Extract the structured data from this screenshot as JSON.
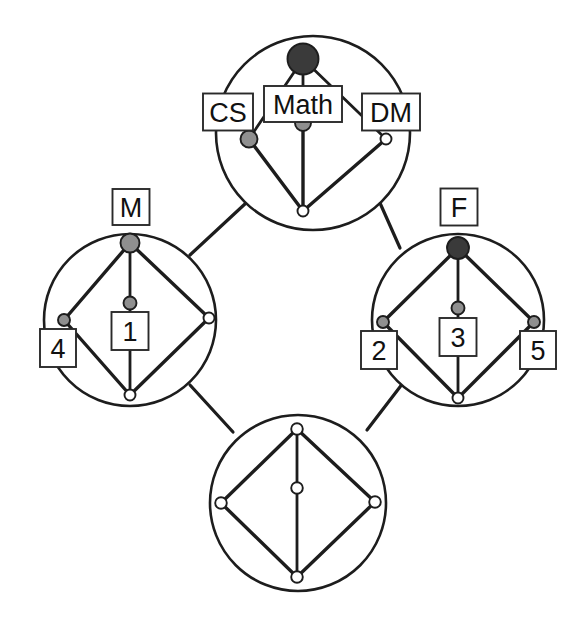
{
  "diagram": {
    "colors": {
      "background": "#ffffff",
      "stroke": "#1d1d1d",
      "vertex_dark": "#3a3a3a",
      "vertex_gray": "#8f8f8f",
      "vertex_white": "#ffffff",
      "label_box_fill": "#ffffff",
      "label_text": "#111111"
    },
    "clusters": [
      {
        "id": "cluster-top",
        "name": "top-cluster",
        "cx": 313,
        "cy": 133,
        "r": 97,
        "vertices": [
          {
            "id": "t-apex",
            "name": "math-vertex",
            "cx": 303,
            "cy": 59,
            "r": 15.5,
            "fill": "vertex_dark",
            "label": "Math",
            "label_x": 303,
            "label_y": 104,
            "box_w": 78,
            "box_h": 36,
            "font_size": 27
          },
          {
            "id": "t-left",
            "name": "cs-vertex",
            "cx": 249,
            "cy": 139,
            "r": 8.5,
            "fill": "vertex_gray",
            "label": "CS",
            "label_x": 228,
            "label_y": 112,
            "box_w": 50,
            "box_h": 37,
            "font_size": 27
          },
          {
            "id": "t-center",
            "name": "center-vertex-top",
            "cx": 303,
            "cy": 123,
            "r": 8.0,
            "fill": "vertex_gray",
            "label": "",
            "label_x": 0,
            "label_y": 0,
            "box_w": 0,
            "box_h": 0,
            "font_size": 0
          },
          {
            "id": "t-right",
            "name": "dm-vertex",
            "cx": 386,
            "cy": 139,
            "r": 5.5,
            "fill": "vertex_white",
            "label": "DM",
            "label_x": 391,
            "label_y": 112,
            "box_w": 58,
            "box_h": 37,
            "font_size": 27
          },
          {
            "id": "t-bottom",
            "name": "bottom-vertex-top",
            "cx": 303,
            "cy": 211,
            "r": 5.5,
            "fill": "vertex_white",
            "label": "",
            "label_x": 0,
            "label_y": 0,
            "box_w": 0,
            "box_h": 0,
            "font_size": 0
          }
        ]
      },
      {
        "id": "cluster-left",
        "name": "left-cluster",
        "cx": 130,
        "cy": 320,
        "r": 86,
        "vertices": [
          {
            "id": "l-apex",
            "name": "m-vertex",
            "cx": 130,
            "cy": 243,
            "r": 9.5,
            "fill": "vertex_gray",
            "label": "M",
            "label_x": 131,
            "label_y": 207,
            "box_w": 37,
            "box_h": 36,
            "font_size": 27
          },
          {
            "id": "l-left",
            "name": "vertex-4",
            "cx": 64,
            "cy": 320,
            "r": 6.0,
            "fill": "vertex_gray",
            "label": "4",
            "label_x": 58,
            "label_y": 348,
            "box_w": 36,
            "box_h": 38,
            "font_size": 27
          },
          {
            "id": "l-center",
            "name": "vertex-1",
            "cx": 130,
            "cy": 303,
            "r": 6.5,
            "fill": "vertex_gray",
            "label": "1",
            "label_x": 130,
            "label_y": 331,
            "box_w": 37,
            "box_h": 38,
            "font_size": 27
          },
          {
            "id": "l-right",
            "name": "right-vertex-left",
            "cx": 209,
            "cy": 318,
            "r": 5.5,
            "fill": "vertex_white",
            "label": "",
            "label_x": 0,
            "label_y": 0,
            "box_w": 0,
            "box_h": 0,
            "font_size": 0
          },
          {
            "id": "l-bottom",
            "name": "bottom-vertex-left",
            "cx": 130,
            "cy": 395,
            "r": 5.5,
            "fill": "vertex_white",
            "label": "",
            "label_x": 0,
            "label_y": 0,
            "box_w": 0,
            "box_h": 0,
            "font_size": 0
          }
        ]
      },
      {
        "id": "cluster-right",
        "name": "right-cluster",
        "cx": 458,
        "cy": 320,
        "r": 86,
        "vertices": [
          {
            "id": "r-apex",
            "name": "f-vertex",
            "cx": 458,
            "cy": 248,
            "r": 11.0,
            "fill": "vertex_dark",
            "label": "F",
            "label_x": 459,
            "label_y": 207,
            "box_w": 37,
            "box_h": 37,
            "font_size": 27
          },
          {
            "id": "r-left",
            "name": "vertex-2",
            "cx": 383,
            "cy": 322,
            "r": 6.0,
            "fill": "vertex_gray",
            "label": "2",
            "label_x": 379,
            "label_y": 350,
            "box_w": 36,
            "box_h": 38,
            "font_size": 27
          },
          {
            "id": "r-center",
            "name": "vertex-3",
            "cx": 458,
            "cy": 308,
            "r": 6.5,
            "fill": "vertex_gray",
            "label": "3",
            "label_x": 458,
            "label_y": 337,
            "box_w": 37,
            "box_h": 38,
            "font_size": 27
          },
          {
            "id": "r-right",
            "name": "vertex-5",
            "cx": 534,
            "cy": 322,
            "r": 6.0,
            "fill": "vertex_gray",
            "label": "5",
            "label_x": 538,
            "label_y": 350,
            "box_w": 36,
            "box_h": 38,
            "font_size": 27
          },
          {
            "id": "r-bottom",
            "name": "bottom-vertex-right",
            "cx": 458,
            "cy": 398,
            "r": 5.5,
            "fill": "vertex_white",
            "label": "",
            "label_x": 0,
            "label_y": 0,
            "box_w": 0,
            "box_h": 0,
            "font_size": 0
          }
        ]
      },
      {
        "id": "cluster-bottom",
        "name": "bottom-cluster",
        "cx": 298,
        "cy": 503,
        "r": 88,
        "vertices": [
          {
            "id": "b-apex",
            "name": "top-vertex-bottom",
            "cx": 297,
            "cy": 429,
            "r": 5.8,
            "fill": "vertex_white",
            "label": "",
            "label_x": 0,
            "label_y": 0,
            "box_w": 0,
            "box_h": 0,
            "font_size": 0
          },
          {
            "id": "b-left",
            "name": "left-vertex-bottom",
            "cx": 221,
            "cy": 503,
            "r": 5.8,
            "fill": "vertex_white",
            "label": "",
            "label_x": 0,
            "label_y": 0,
            "box_w": 0,
            "box_h": 0,
            "font_size": 0
          },
          {
            "id": "b-center",
            "name": "center-vertex-bottom",
            "cx": 297,
            "cy": 488,
            "r": 5.8,
            "fill": "vertex_white",
            "label": "",
            "label_x": 0,
            "label_y": 0,
            "box_w": 0,
            "box_h": 0,
            "font_size": 0
          },
          {
            "id": "b-right",
            "name": "right-vertex-bottom",
            "cx": 375,
            "cy": 502,
            "r": 5.8,
            "fill": "vertex_white",
            "label": "",
            "label_x": 0,
            "label_y": 0,
            "box_w": 0,
            "box_h": 0,
            "font_size": 0
          },
          {
            "id": "b-bottom",
            "name": "bottom-vertex-bottom",
            "cx": 297,
            "cy": 577,
            "r": 5.8,
            "fill": "vertex_white",
            "label": "",
            "label_x": 0,
            "label_y": 0,
            "box_w": 0,
            "box_h": 0,
            "font_size": 0
          }
        ]
      }
    ],
    "intra_edges": [
      {
        "name": "edge-math-cs",
        "x1": 303,
        "y1": 59,
        "x2": 249,
        "y2": 139,
        "weight": "thin"
      },
      {
        "name": "edge-math-dm",
        "x1": 303,
        "y1": 59,
        "x2": 386,
        "y2": 139,
        "weight": "thin"
      },
      {
        "name": "edge-math-center",
        "x1": 303,
        "y1": 59,
        "x2": 303,
        "y2": 123,
        "weight": "thin"
      },
      {
        "name": "edge-center-bottom-top",
        "x1": 303,
        "y1": 123,
        "x2": 303,
        "y2": 211,
        "weight": "bold"
      },
      {
        "name": "edge-cs-bottom",
        "x1": 249,
        "y1": 139,
        "x2": 303,
        "y2": 211,
        "weight": "bold"
      },
      {
        "name": "edge-dm-bottom",
        "x1": 386,
        "y1": 139,
        "x2": 303,
        "y2": 211,
        "weight": "bold"
      },
      {
        "name": "edge-m-4",
        "x1": 130,
        "y1": 243,
        "x2": 64,
        "y2": 320,
        "weight": "bold"
      },
      {
        "name": "edge-m-right-l",
        "x1": 130,
        "y1": 243,
        "x2": 209,
        "y2": 318,
        "weight": "bold"
      },
      {
        "name": "edge-m-1",
        "x1": 130,
        "y1": 243,
        "x2": 130,
        "y2": 303,
        "weight": "thin"
      },
      {
        "name": "edge-1-bottom-l",
        "x1": 130,
        "y1": 303,
        "x2": 130,
        "y2": 395,
        "weight": "thin"
      },
      {
        "name": "edge-4-bottom-l",
        "x1": 64,
        "y1": 320,
        "x2": 130,
        "y2": 395,
        "weight": "bold"
      },
      {
        "name": "edge-right-bottom-l",
        "x1": 209,
        "y1": 318,
        "x2": 130,
        "y2": 395,
        "weight": "bold"
      },
      {
        "name": "edge-f-2",
        "x1": 458,
        "y1": 248,
        "x2": 383,
        "y2": 322,
        "weight": "bold"
      },
      {
        "name": "edge-f-5",
        "x1": 458,
        "y1": 248,
        "x2": 534,
        "y2": 322,
        "weight": "bold"
      },
      {
        "name": "edge-f-3",
        "x1": 458,
        "y1": 248,
        "x2": 458,
        "y2": 308,
        "weight": "thin"
      },
      {
        "name": "edge-3-bottom-r",
        "x1": 458,
        "y1": 308,
        "x2": 458,
        "y2": 398,
        "weight": "thin"
      },
      {
        "name": "edge-2-bottom-r",
        "x1": 383,
        "y1": 322,
        "x2": 458,
        "y2": 398,
        "weight": "bold"
      },
      {
        "name": "edge-5-bottom-r",
        "x1": 534,
        "y1": 322,
        "x2": 458,
        "y2": 398,
        "weight": "bold"
      },
      {
        "name": "edge-btop-bleft",
        "x1": 297,
        "y1": 429,
        "x2": 221,
        "y2": 503,
        "weight": "bold"
      },
      {
        "name": "edge-btop-bright",
        "x1": 297,
        "y1": 429,
        "x2": 375,
        "y2": 502,
        "weight": "bold"
      },
      {
        "name": "edge-btop-bcenter",
        "x1": 297,
        "y1": 429,
        "x2": 297,
        "y2": 488,
        "weight": "thin"
      },
      {
        "name": "edge-bcenter-bbot",
        "x1": 297,
        "y1": 488,
        "x2": 297,
        "y2": 577,
        "weight": "thin"
      },
      {
        "name": "edge-bleft-bbot",
        "x1": 221,
        "y1": 503,
        "x2": 297,
        "y2": 577,
        "weight": "bold"
      },
      {
        "name": "edge-bright-bbot",
        "x1": 375,
        "y1": 502,
        "x2": 297,
        "y2": 577,
        "weight": "bold"
      }
    ],
    "bridge_edges": [
      {
        "name": "bridge-top-left",
        "x1": 246,
        "y1": 203,
        "x2": 190,
        "y2": 255
      },
      {
        "name": "bridge-top-right",
        "x1": 380,
        "y1": 203,
        "x2": 400,
        "y2": 248
      },
      {
        "name": "bridge-left-bottom",
        "x1": 190,
        "y1": 385,
        "x2": 233,
        "y2": 432
      },
      {
        "name": "bridge-right-bottom",
        "x1": 403,
        "y1": 383,
        "x2": 367,
        "y2": 430
      }
    ]
  }
}
